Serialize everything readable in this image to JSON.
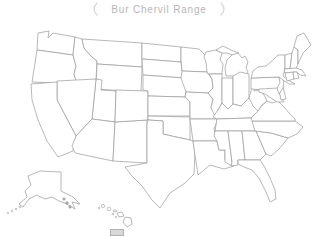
{
  "title": {
    "text": "Bur Chervil Range"
  },
  "colors": {
    "in_range": "#d8d8d8",
    "out_of_range": "#ffffff",
    "border": "#999999",
    "title_text": "#b6b6b6",
    "bracket": "#d6d6d6",
    "background": "#ffffff"
  },
  "legend": {
    "swatch_meaning": "in-range"
  },
  "map": {
    "states": [
      {
        "id": "WA",
        "name": "Washington",
        "in_range": true
      },
      {
        "id": "OR",
        "name": "Oregon",
        "in_range": true
      },
      {
        "id": "CA",
        "name": "California",
        "in_range": true
      },
      {
        "id": "ID",
        "name": "Idaho",
        "in_range": true
      },
      {
        "id": "NV",
        "name": "Nevada",
        "in_range": false
      },
      {
        "id": "MT",
        "name": "Montana",
        "in_range": false
      },
      {
        "id": "WY",
        "name": "Wyoming",
        "in_range": true
      },
      {
        "id": "UT",
        "name": "Utah",
        "in_range": false
      },
      {
        "id": "CO",
        "name": "Colorado",
        "in_range": false
      },
      {
        "id": "AZ",
        "name": "Arizona",
        "in_range": true
      },
      {
        "id": "NM",
        "name": "New Mexico",
        "in_range": false
      },
      {
        "id": "ND",
        "name": "North Dakota",
        "in_range": false
      },
      {
        "id": "SD",
        "name": "South Dakota",
        "in_range": false
      },
      {
        "id": "NE",
        "name": "Nebraska",
        "in_range": true
      },
      {
        "id": "KS",
        "name": "Kansas",
        "in_range": false
      },
      {
        "id": "OK",
        "name": "Oklahoma",
        "in_range": true
      },
      {
        "id": "TX",
        "name": "Texas",
        "in_range": false
      },
      {
        "id": "MN",
        "name": "Minnesota",
        "in_range": false
      },
      {
        "id": "IA",
        "name": "Iowa",
        "in_range": false
      },
      {
        "id": "MO",
        "name": "Missouri",
        "in_range": true
      },
      {
        "id": "AR",
        "name": "Arkansas",
        "in_range": true
      },
      {
        "id": "LA",
        "name": "Louisiana",
        "in_range": true
      },
      {
        "id": "WI",
        "name": "Wisconsin",
        "in_range": false
      },
      {
        "id": "MI",
        "name": "Michigan",
        "in_range": false
      },
      {
        "id": "IL",
        "name": "Illinois",
        "in_range": true
      },
      {
        "id": "IN",
        "name": "Indiana",
        "in_range": true
      },
      {
        "id": "OH",
        "name": "Ohio",
        "in_range": true
      },
      {
        "id": "KY",
        "name": "Kentucky",
        "in_range": true
      },
      {
        "id": "TN",
        "name": "Tennessee",
        "in_range": true
      },
      {
        "id": "MS",
        "name": "Mississippi",
        "in_range": false
      },
      {
        "id": "AL",
        "name": "Alabama",
        "in_range": true
      },
      {
        "id": "GA",
        "name": "Georgia",
        "in_range": true
      },
      {
        "id": "FL",
        "name": "Florida",
        "in_range": false
      },
      {
        "id": "SC",
        "name": "South Carolina",
        "in_range": true
      },
      {
        "id": "NC",
        "name": "North Carolina",
        "in_range": true
      },
      {
        "id": "VA",
        "name": "Virginia",
        "in_range": true
      },
      {
        "id": "WV",
        "name": "West Virginia",
        "in_range": true
      },
      {
        "id": "MD",
        "name": "Maryland",
        "in_range": true
      },
      {
        "id": "DE",
        "name": "Delaware",
        "in_range": true
      },
      {
        "id": "PA",
        "name": "Pennsylvania",
        "in_range": false
      },
      {
        "id": "NJ",
        "name": "New Jersey",
        "in_range": true
      },
      {
        "id": "NY",
        "name": "New York",
        "in_range": true
      },
      {
        "id": "VT",
        "name": "Vermont",
        "in_range": false
      },
      {
        "id": "NH",
        "name": "New Hampshire",
        "in_range": false
      },
      {
        "id": "ME",
        "name": "Maine",
        "in_range": false
      },
      {
        "id": "MA",
        "name": "Massachusetts",
        "in_range": true
      },
      {
        "id": "CT",
        "name": "Connecticut",
        "in_range": true
      },
      {
        "id": "RI",
        "name": "Rhode Island",
        "in_range": true
      },
      {
        "id": "AK",
        "name": "Alaska",
        "in_range": false
      },
      {
        "id": "HI",
        "name": "Hawaii",
        "in_range": false
      }
    ]
  }
}
